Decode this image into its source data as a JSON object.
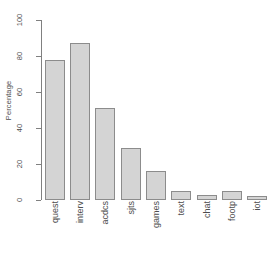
{
  "chart_data": {
    "type": "bar",
    "title": "",
    "xlabel": "",
    "ylabel": "Percentage",
    "categories": [
      "quest",
      "interv",
      "acdcs",
      "sjts",
      "games",
      "text",
      "chat",
      "footp",
      "iot"
    ],
    "values": [
      78,
      87,
      51,
      29,
      16,
      5,
      3,
      5,
      2
    ],
    "ylim": [
      0,
      100
    ],
    "yticks": [
      0,
      20,
      40,
      60,
      80,
      100
    ],
    "ytick_labels": [
      "0",
      "20",
      "40",
      "60",
      "80",
      "100"
    ],
    "grid": false,
    "legend": null,
    "colors": {
      "bar_fill": "#d4d4d4",
      "bar_border": "#8c8c8c",
      "axis": "#808080",
      "text": "#4d4d4d",
      "background": "#ffffff"
    }
  }
}
